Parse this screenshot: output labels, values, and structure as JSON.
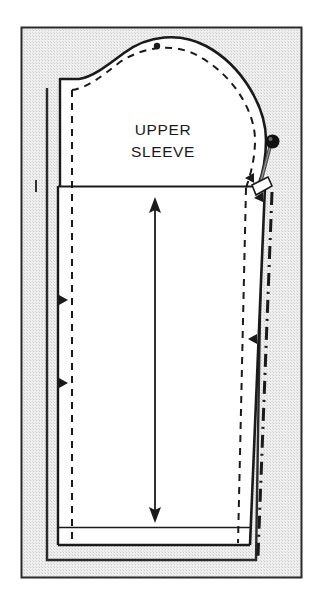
{
  "figure": {
    "kind": "sewing-pattern-diagram",
    "title_on_piece": "UPPER\nSLEEVE",
    "label_lines": [
      "UPPER",
      "SLEEVE"
    ],
    "label_line_1": "UPPER",
    "label_line_2": "SLEEVE",
    "background_color": "#e9e9e9",
    "paper_color": "#ffffff",
    "ink_color": "#1a1a1a",
    "frame": {
      "x": 21,
      "y": 27,
      "width": 281,
      "height": 551,
      "border_color": "#2b2b2b",
      "fill_color": "#e9e9e9"
    },
    "elements": [
      {
        "name": "cutting-line",
        "label": "Cutting line",
        "style": "solid",
        "color": "#1a1a1a"
      },
      {
        "name": "stitching-line",
        "label": "Stitching / seam line",
        "style": "dashed",
        "color": "#1a1a1a"
      },
      {
        "name": "fold-extension-line",
        "label": "Fold / extension line",
        "style": "dash-dot",
        "color": "#1a1a1a"
      },
      {
        "name": "grainline-arrow",
        "label": "Grainline",
        "style": "double-headed-arrow",
        "color": "#1a1a1a",
        "from_y": 200,
        "to_y": 520,
        "x": 155
      },
      {
        "name": "shoulder-dot",
        "label": "Shoulder match point",
        "style": "dot"
      },
      {
        "name": "notch-left-upper",
        "label": "Single notch (left)",
        "style": "triangle"
      },
      {
        "name": "notch-left-lower",
        "label": "Single notch (left)",
        "style": "triangle"
      },
      {
        "name": "notch-right-upper",
        "label": "Single notch (right)",
        "style": "triangle"
      },
      {
        "name": "notch-right-lower",
        "label": "Single notch (right)",
        "style": "triangle"
      },
      {
        "name": "straight-pin",
        "label": "Straight pin with round head",
        "style": "pin",
        "head_color": "#111111",
        "shaft_color": "#555555",
        "head_x": 273,
        "head_y": 142
      },
      {
        "name": "hem-line",
        "label": "Hem fold line",
        "style": "solid"
      },
      {
        "name": "tick-mark-left",
        "label": "Short tick mark",
        "style": "short-vertical-line"
      }
    ]
  }
}
